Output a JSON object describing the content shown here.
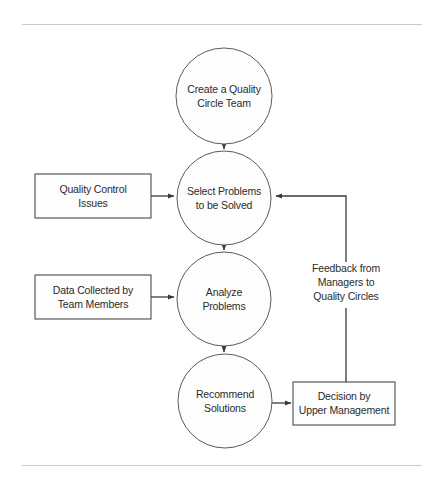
{
  "page": {
    "background_color": "#ffffff",
    "rule_color": "#c9c9c9",
    "text_color": "#2b2b2b",
    "shape_fill": "#fdfdfd",
    "shape_stroke": "#5c5c5c",
    "connector_color": "#3a3a3a"
  },
  "diagram": {
    "type": "flowchart",
    "orientation": "vertical-with-feedback-loop",
    "nodes": [
      {
        "id": "create-team",
        "shape": "circle",
        "lines": [
          "Create a Quality",
          "Circle Team"
        ],
        "cx": 224,
        "cy": 96,
        "r": 48
      },
      {
        "id": "select-problems",
        "shape": "circle",
        "lines": [
          "Select Problems",
          "to be Solved"
        ],
        "cx": 224,
        "cy": 198,
        "r": 47
      },
      {
        "id": "analyze-problems",
        "shape": "circle",
        "lines": [
          "Analyze",
          "Problems"
        ],
        "cx": 224,
        "cy": 299,
        "r": 47
      },
      {
        "id": "recommend-solutions",
        "shape": "circle",
        "lines": [
          "Recommend",
          "Solutions"
        ],
        "cx": 225,
        "cy": 401,
        "r": 47
      },
      {
        "id": "quality-control-issues",
        "shape": "rect",
        "lines": [
          "Quality Control",
          "Issues"
        ],
        "x": 35,
        "y": 174,
        "w": 116,
        "h": 44
      },
      {
        "id": "data-collected",
        "shape": "rect",
        "lines": [
          "Data Collected by",
          "Team Members"
        ],
        "x": 35,
        "y": 275,
        "w": 116,
        "h": 44
      },
      {
        "id": "decision-upper-management",
        "shape": "rect",
        "lines": [
          "Decision by",
          "Upper Management"
        ],
        "x": 293,
        "y": 382,
        "w": 102,
        "h": 43
      }
    ],
    "free_labels": [
      {
        "id": "feedback-label",
        "lines": [
          "Feedback from",
          "Managers to",
          "Quality Circles"
        ],
        "cx": 346,
        "cy": 285
      }
    ],
    "edges": [
      {
        "id": "create-to-select",
        "from": "create-team",
        "to": "select-problems",
        "arrow": true
      },
      {
        "id": "select-to-analyze",
        "from": "select-problems",
        "to": "analyze-problems",
        "arrow": true
      },
      {
        "id": "analyze-to-recommend",
        "from": "analyze-problems",
        "to": "recommend-solutions",
        "arrow": true
      },
      {
        "id": "issues-to-select",
        "from": "quality-control-issues",
        "to": "select-problems",
        "arrow": true
      },
      {
        "id": "data-to-analyze",
        "from": "data-collected",
        "to": "analyze-problems",
        "arrow": true
      },
      {
        "id": "recommend-to-decision",
        "from": "recommend-solutions",
        "to": "decision-upper-management",
        "arrow": true
      },
      {
        "id": "feedback-loop",
        "from": "decision-upper-management",
        "to": "select-problems",
        "arrow": true,
        "routing": "up-then-left"
      }
    ]
  }
}
